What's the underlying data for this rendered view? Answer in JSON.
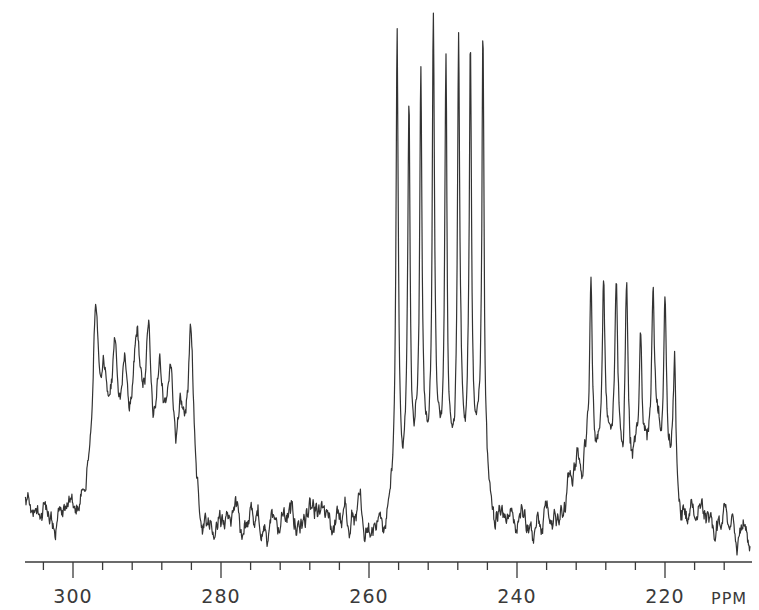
{
  "chart_data": {
    "type": "line",
    "title": "",
    "xlabel": "PPM",
    "ylabel": "",
    "x_reversed": true,
    "xlim": [
      306.5,
      210
    ],
    "major_ticks": [
      300,
      280,
      260,
      240,
      220
    ],
    "minor_tick_step": 4,
    "tick_labels": [
      "300",
      "280",
      "260",
      "240",
      "220"
    ],
    "unit_label": "PPM",
    "grid": false,
    "line_color": "#333333",
    "baseline_intensity": 0.0,
    "multiplets": [
      {
        "name": "left-multiplet",
        "range_ppm": [
          297.5,
          283.5
        ],
        "plateau": 0.33,
        "peaks_ppm": [
          297.0,
          295.9,
          294.3,
          293.0,
          291.3,
          289.8,
          288.3,
          286.8,
          284.1
        ],
        "peaks_height": [
          0.93,
          0.66,
          0.71,
          0.6,
          0.74,
          0.74,
          0.64,
          0.58,
          0.85
        ]
      },
      {
        "name": "center-multiplet",
        "range_ppm": [
          256.8,
          244.2
        ],
        "plateau": 0.3,
        "peaks_ppm": [
          256.2,
          254.6,
          253.0,
          251.3,
          249.6,
          247.9,
          246.3,
          244.6
        ],
        "peaks_height": [
          2.14,
          1.87,
          2.01,
          2.15,
          2.06,
          2.04,
          2.02,
          2.27
        ]
      },
      {
        "name": "right-multiplet",
        "range_ppm": [
          233.0,
          218.8
        ],
        "plateau": 0.28,
        "peaks_ppm": [
          230.0,
          228.3,
          226.6,
          225.2,
          223.3,
          221.6,
          220.0,
          218.7
        ],
        "peaks_height": [
          1.07,
          1.06,
          1.02,
          1.05,
          0.92,
          0.98,
          1.02,
          0.88
        ]
      }
    ],
    "noise_amplitude": 0.08
  }
}
